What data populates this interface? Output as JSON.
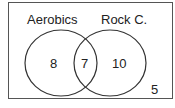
{
  "diagram": {
    "type": "venn",
    "sets": [
      {
        "label": "Aerobics",
        "only_count": "8"
      },
      {
        "label": "Rock C.",
        "only_count": "10"
      }
    ],
    "intersection_count": "7",
    "outside_count": "5",
    "colors": {
      "stroke": "#333333",
      "background": "#ffffff",
      "text": "#222222"
    }
  }
}
